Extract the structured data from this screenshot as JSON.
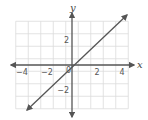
{
  "chart_data": {
    "type": "line",
    "title": "",
    "xlabel": "x",
    "ylabel": "y",
    "xlim": [
      -4.5,
      4.5
    ],
    "ylim": [
      -4,
      4
    ],
    "grid": true,
    "x_ticks": [
      -4,
      -2,
      2,
      4
    ],
    "y_ticks": [
      2,
      -2
    ],
    "x_tick_labels": [
      "−4",
      "−2",
      "2",
      "4"
    ],
    "y_tick_labels": [
      "2",
      "−2"
    ],
    "origin_label": "0",
    "series": [
      {
        "name": "y = x",
        "equation": "y = x",
        "x": [
          -3.6,
          4.4
        ],
        "y": [
          -3.6,
          4.0
        ],
        "arrows_both_ends": true
      }
    ],
    "colors": {
      "axis": "#555555",
      "line": "#555555",
      "grid": "#dddddd"
    }
  }
}
